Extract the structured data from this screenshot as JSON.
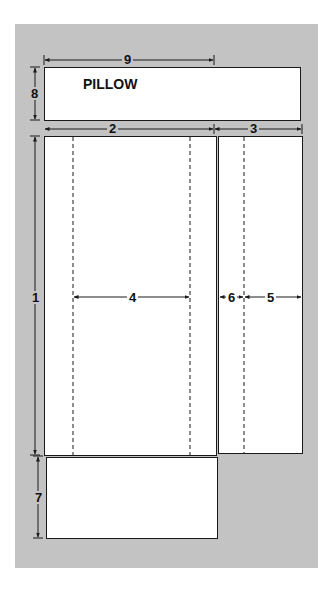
{
  "diagram": {
    "pieces": [
      {
        "id": "pillow",
        "label": "PILLOW"
      },
      {
        "id": "main-panel",
        "label": ""
      },
      {
        "id": "side-panel",
        "label": ""
      },
      {
        "id": "bottom-panel",
        "label": ""
      }
    ],
    "dimensions": {
      "d1": "1",
      "d2": "2",
      "d3": "3",
      "d4": "4",
      "d5": "5",
      "d6": "6",
      "d7": "7",
      "d8": "8",
      "d9": "9"
    },
    "colors": {
      "background": "#c3c3c3",
      "piece_fill": "#ffffff",
      "line": "#1a1a1a"
    }
  }
}
